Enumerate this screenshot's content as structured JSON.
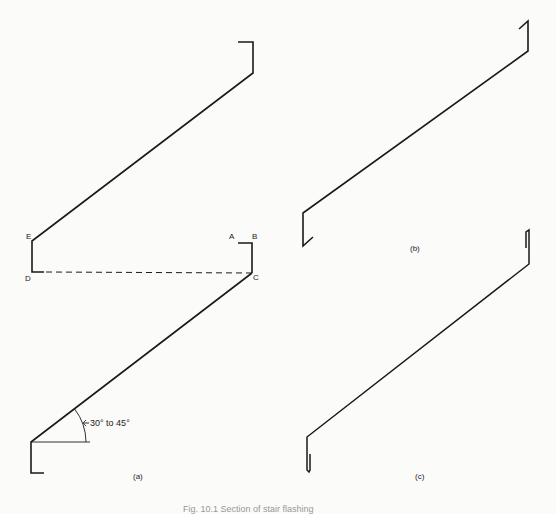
{
  "figure": {
    "panels": [
      {
        "id": "a",
        "label": "(a)",
        "points": {
          "A": "A",
          "B": "B",
          "C": "C",
          "D": "D",
          "E": "E"
        },
        "angle_annotation": "30° to 45°"
      },
      {
        "id": "b",
        "label": "(b)"
      },
      {
        "id": "c",
        "label": "(c)"
      }
    ],
    "caption": "Fig. 10.1  Section of stair flashing"
  },
  "colors": {
    "line": "#1a1a1a",
    "background": "#fbfbfa",
    "text": "#222222"
  }
}
